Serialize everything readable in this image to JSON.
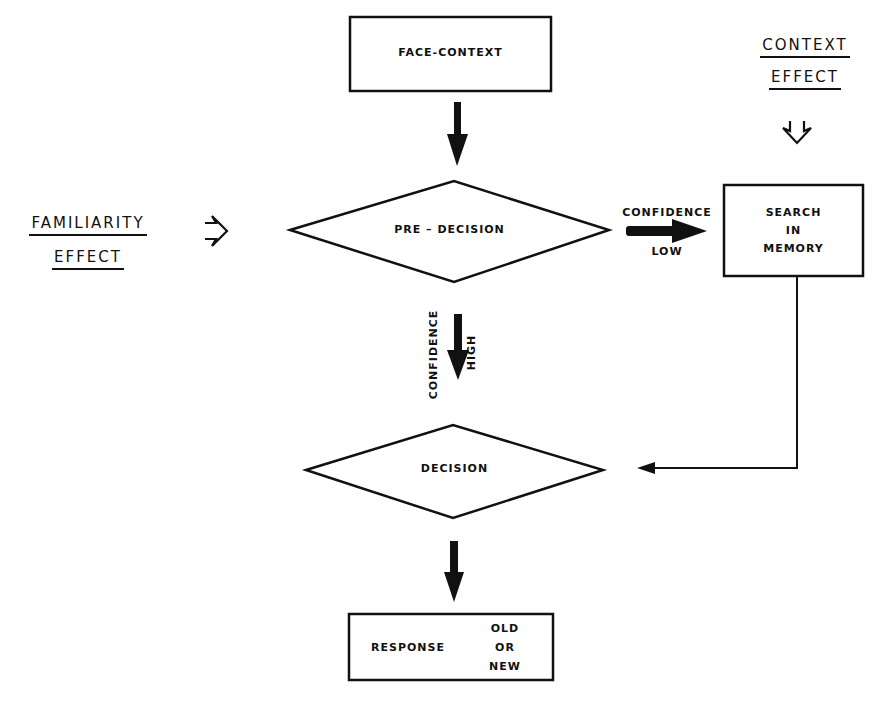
{
  "diagram": {
    "nodes": {
      "face_context": {
        "label": "FACE-CONTEXT",
        "shape": "rectangle"
      },
      "pre_decision": {
        "label": "PRE – DECISION",
        "shape": "diamond"
      },
      "search_memory": {
        "line1": "SEARCH",
        "line2": "IN",
        "line3": "MEMORY",
        "shape": "rectangle"
      },
      "decision": {
        "label": "DECISION",
        "shape": "diamond"
      },
      "response": {
        "label": "RESPONSE",
        "option1": "OLD",
        "option2": "OR",
        "option3": "NEW",
        "shape": "rectangle"
      }
    },
    "edges": {
      "low": {
        "top": "CONFIDENCE",
        "bottom": "LOW"
      },
      "high": {
        "left": "CONFIDENCE",
        "right": "HIGH"
      }
    },
    "effects": {
      "context": {
        "line1": "CONTEXT",
        "line2": "EFFECT"
      },
      "familiarity": {
        "line1": "FAMILIARITY",
        "line2": "EFFECT"
      }
    }
  }
}
